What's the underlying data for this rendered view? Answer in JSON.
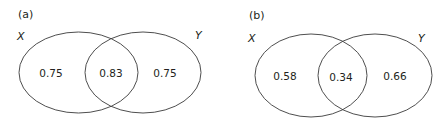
{
  "panels": [
    {
      "label": "(a)",
      "set_left": "X",
      "set_right": "Y",
      "values": {
        "left_only": "0.75",
        "intersection": "0.83",
        "right_only": "0.75"
      }
    },
    {
      "label": "(b)",
      "set_left": "X",
      "set_right": "Y",
      "values": {
        "left_only": "0.58",
        "intersection": "0.34",
        "right_only": "0.66"
      }
    }
  ],
  "colors": {
    "stroke": "#3a3a3a",
    "text": "#231f20"
  }
}
